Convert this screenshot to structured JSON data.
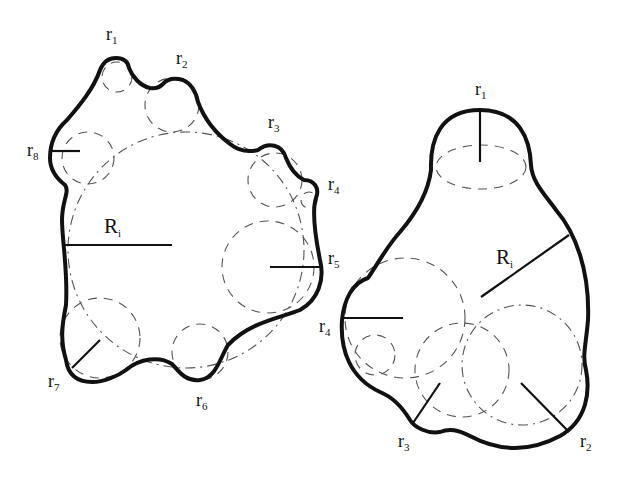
{
  "figure": {
    "colors": {
      "outline": "#111111",
      "construction": "#555555",
      "background": "#ffffff"
    }
  },
  "left_shape": {
    "inner_radius_label": {
      "main": "R",
      "sub": "i"
    },
    "radius_labels": [
      {
        "id": "r1",
        "main": "r",
        "sub": "1"
      },
      {
        "id": "r2",
        "main": "r",
        "sub": "2"
      },
      {
        "id": "r3",
        "main": "r",
        "sub": "3"
      },
      {
        "id": "r4",
        "main": "r",
        "sub": "4"
      },
      {
        "id": "r5",
        "main": "r",
        "sub": "5"
      },
      {
        "id": "r6",
        "main": "r",
        "sub": "6"
      },
      {
        "id": "r7",
        "main": "r",
        "sub": "7"
      },
      {
        "id": "r8",
        "main": "r",
        "sub": "8"
      }
    ]
  },
  "right_shape": {
    "inner_radius_label": {
      "main": "R",
      "sub": "i"
    },
    "radius_labels": [
      {
        "id": "r1",
        "main": "r",
        "sub": "1"
      },
      {
        "id": "r2",
        "main": "r",
        "sub": "2"
      },
      {
        "id": "r3",
        "main": "r",
        "sub": "3"
      },
      {
        "id": "r4",
        "main": "r",
        "sub": "4"
      }
    ]
  }
}
